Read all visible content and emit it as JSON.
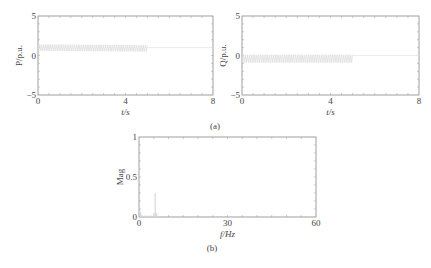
{
  "chart_data": [
    {
      "id": "P",
      "type": "line",
      "title": "",
      "xlabel": "t/s",
      "ylabel": "P/p.u.",
      "xlim": [
        0,
        8
      ],
      "ylim": [
        -5,
        5
      ],
      "xticks": [
        "0",
        "4",
        "8"
      ],
      "yticks": [
        "-5",
        "0",
        "5"
      ],
      "grid": false,
      "description": "Oscillating active power around ~1 p.u. between 0 and ~5 s (envelope ~0.5 to ~1.4), then steady at ~1 p.u.",
      "series": [
        {
          "name": "P",
          "x": [
            0,
            5,
            5,
            8
          ],
          "upper": [
            1.4,
            1.3,
            1.0,
            1.0
          ],
          "lower": [
            0.6,
            0.5,
            1.0,
            1.0
          ],
          "color": "#dddddd"
        }
      ]
    },
    {
      "id": "Q",
      "type": "line",
      "title": "",
      "xlabel": "t/s",
      "ylabel": "Q/p.u.",
      "xlim": [
        0,
        8
      ],
      "ylim": [
        -5,
        5
      ],
      "xticks": [
        "0",
        "4",
        "8"
      ],
      "yticks": [
        "-5",
        "0",
        "5"
      ],
      "grid": false,
      "description": "Oscillating reactive power between ~0 and ~-0.9 p.u. from 0 to ~5 s, then steady at ~0 p.u.",
      "series": [
        {
          "name": "Q",
          "x": [
            0,
            5,
            5,
            8
          ],
          "upper": [
            0.1,
            0.1,
            0.0,
            0.0
          ],
          "lower": [
            -0.9,
            -0.9,
            0.0,
            0.0
          ],
          "color": "#dddddd"
        }
      ]
    },
    {
      "id": "spectrum",
      "type": "bar",
      "title": "",
      "xlabel": "f/Hz",
      "ylabel": "Mag",
      "xlim": [
        0,
        60
      ],
      "ylim": [
        0,
        1
      ],
      "xticks": [
        "0",
        "30",
        "60"
      ],
      "yticks": [
        "0",
        "0.5",
        "1"
      ],
      "grid": false,
      "description": "FFT magnitude spectrum with dominant peak near 5.5 Hz (~0.3) and small low-frequency content.",
      "x": [
        0.5,
        1,
        2,
        3,
        4,
        5,
        5.5,
        6,
        7
      ],
      "values": [
        0.06,
        0.03,
        0.02,
        0.02,
        0.02,
        0.05,
        0.3,
        0.05,
        0.01
      ]
    }
  ],
  "captions": {
    "a": "(a)",
    "b": "(b)"
  }
}
